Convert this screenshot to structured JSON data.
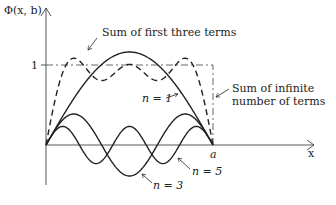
{
  "figure": {
    "y_axis_label": "Φ(x, b)",
    "x_axis_label": "x",
    "y_tick_one": "1",
    "x_tick_a": "a",
    "annotations": {
      "sum_three": "Sum of first three terms",
      "sum_infinite_line1": "Sum of infinite",
      "sum_infinite_line2": "number of terms",
      "n1": "n = 1",
      "n3": "n = 3",
      "n5": "n = 5"
    },
    "colors": {
      "curve": "#222222",
      "background": "#ffffff"
    }
  },
  "chart_data": {
    "type": "line",
    "title": "",
    "xlabel": "x",
    "ylabel": "Φ(x, b)",
    "x_range": [
      0,
      "a"
    ],
    "series": [
      {
        "name": "n = 1",
        "style": "solid",
        "formula": "(4/π) sin(πx/a)"
      },
      {
        "name": "n = 3",
        "style": "solid",
        "formula": "(4/3π) sin(3πx/a)"
      },
      {
        "name": "n = 5",
        "style": "solid",
        "formula": "(4/5π) sin(5πx/a)"
      },
      {
        "name": "Sum of first three terms",
        "style": "dashed"
      },
      {
        "name": "Sum of infinite number of terms",
        "style": "dash-dot",
        "value": 1
      }
    ],
    "grid": false
  }
}
